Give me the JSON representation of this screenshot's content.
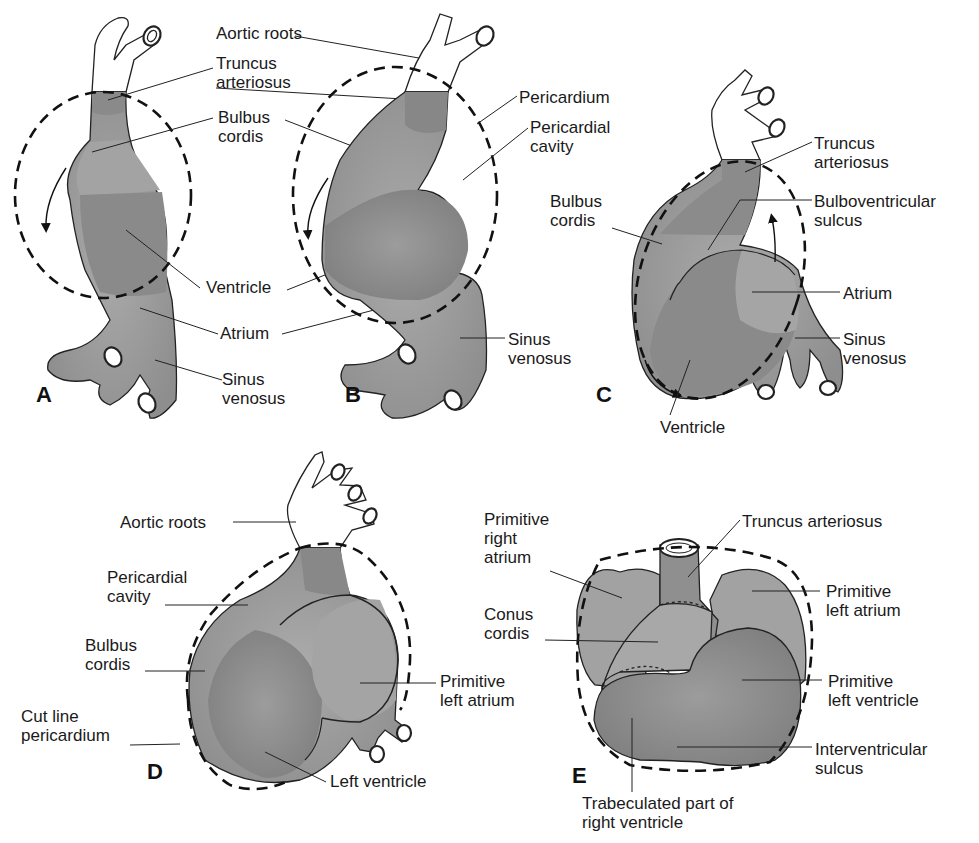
{
  "figure": {
    "colors": {
      "tissue": "#9a9a9a",
      "tissue_dark": "#858585",
      "tissue_light": "#acacac",
      "outline": "#222222",
      "vessel_fill": "#ffffff",
      "background": "#ffffff"
    }
  },
  "panels": [
    {
      "id": "A",
      "letter": "A",
      "labels": [
        {
          "text": "Aortic roots",
          "x": 215,
          "y": 24
        },
        {
          "text": "Truncus\narteriosus",
          "x": 215,
          "y": 54
        },
        {
          "text": "Bulbus\ncordis",
          "x": 218,
          "y": 108
        },
        {
          "text": "Ventricle",
          "x": 206,
          "y": 276
        },
        {
          "text": "Atrium",
          "x": 220,
          "y": 322
        },
        {
          "text": "Sinus\nvenosus",
          "x": 222,
          "y": 370
        }
      ]
    },
    {
      "id": "B",
      "letter": "B",
      "labels": [
        {
          "text": "Pericardium",
          "x": 519,
          "y": 88
        },
        {
          "text": "Pericardial\ncavity",
          "x": 530,
          "y": 118
        },
        {
          "text": "Sinus\nvenosus",
          "x": 508,
          "y": 330
        }
      ]
    },
    {
      "id": "C",
      "letter": "C",
      "labels": [
        {
          "text": "Bulbus\ncordis",
          "x": 550,
          "y": 192
        },
        {
          "text": "Truncus\narteriosus",
          "x": 814,
          "y": 134
        },
        {
          "text": "Bulboventricular\nsulcus",
          "x": 814,
          "y": 192
        },
        {
          "text": "Atrium",
          "x": 843,
          "y": 284
        },
        {
          "text": "Sinus\nvenosus",
          "x": 843,
          "y": 330
        },
        {
          "text": "Ventricle",
          "x": 660,
          "y": 418
        }
      ]
    },
    {
      "id": "D",
      "letter": "D",
      "labels": [
        {
          "text": "Aortic roots",
          "x": 120,
          "y": 513
        },
        {
          "text": "Pericardial\ncavity",
          "x": 107,
          "y": 568
        },
        {
          "text": "Bulbus\ncordis",
          "x": 85,
          "y": 636
        },
        {
          "text": "Cut line\npericardium",
          "x": 21,
          "y": 707
        },
        {
          "text": "Primitive\nleft atrium",
          "x": 440,
          "y": 672
        },
        {
          "text": "Left ventricle",
          "x": 330,
          "y": 769
        }
      ]
    },
    {
      "id": "E",
      "letter": "E",
      "labels": [
        {
          "text": "Primitive\nright\natrium",
          "x": 484,
          "y": 510
        },
        {
          "text": "Truncus arteriosus",
          "x": 742,
          "y": 512
        },
        {
          "text": "Conus\ncordis",
          "x": 484,
          "y": 605
        },
        {
          "text": "Primitive\nleft atrium",
          "x": 826,
          "y": 578
        },
        {
          "text": "Primitive\nleft ventricle",
          "x": 828,
          "y": 672
        },
        {
          "text": "Interventricular\nsulcus",
          "x": 815,
          "y": 740
        },
        {
          "text": "Trabeculated part of\nright ventricle",
          "x": 582,
          "y": 794
        }
      ]
    }
  ]
}
